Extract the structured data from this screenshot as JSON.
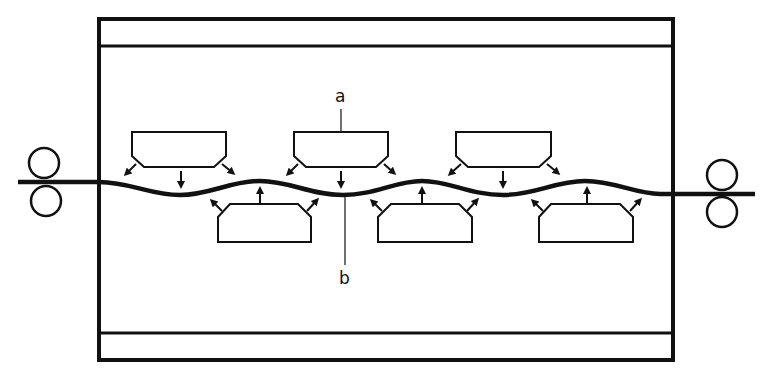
{
  "diagram": {
    "type": "floating strip furnace / air-cushion strip dryer schematic",
    "stroke_color": "#111111",
    "background": "#ffffff",
    "labels": {
      "a": "a",
      "b": "b"
    },
    "components": {
      "housing": "rectangular enclosure with inner top and bottom walls",
      "strip": "continuous wavy strip passing through the enclosure",
      "upper_nozzles": 3,
      "lower_nozzles": 3,
      "roller_pairs": 2
    }
  }
}
